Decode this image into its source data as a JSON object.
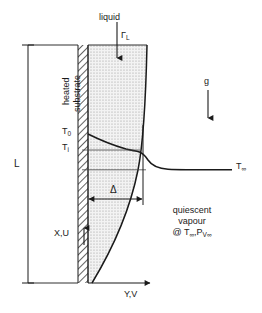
{
  "figure": {
    "type": "schematic-diagram",
    "background_color": "#ffffff",
    "line_color": "#1a1a1a"
  },
  "labels": {
    "liquid": "liquid",
    "liquid_flow_rate": "Γ",
    "liquid_flow_rate_sub": "L",
    "gravity": "g",
    "substrate": "heated\nsubstrate",
    "substrate_line1": "heated",
    "substrate_line2": "substrate",
    "length": "L",
    "wall_temperature": "T",
    "wall_temperature_sub": "0",
    "interface_temperature": "T",
    "interface_temperature_sub": "i",
    "ambient_temperature": "T",
    "ambient_temperature_sub": "∞",
    "film_thickness": "Δ",
    "vapour_line1": "quiescent",
    "vapour_line2": "vapour",
    "vapour_line3": "@ T",
    "vapour_line3_sub1": "∞",
    "vapour_line3_mid": ",P",
    "vapour_line3_sub2": "V∞",
    "axis_x": "X,U",
    "axis_y": "Y,V"
  },
  "geometry": {
    "substrate_left_x": 78,
    "substrate_right_x": 88,
    "top_y": 45,
    "bottom_y": 283,
    "film_top_right_x": 147,
    "film_bottom_x": 92,
    "delta_y": 199,
    "delta_left_x": 88,
    "delta_right_x": 143,
    "t_wall_y": 134,
    "t_interface_y": 150,
    "t_infinity_y": 165,
    "profile_end_x": 232
  },
  "colors": {
    "line": "#1a1a1a",
    "film_fill": "#e8e8e8",
    "hatch": "#4a4a4a",
    "thin_line": "#555555"
  }
}
